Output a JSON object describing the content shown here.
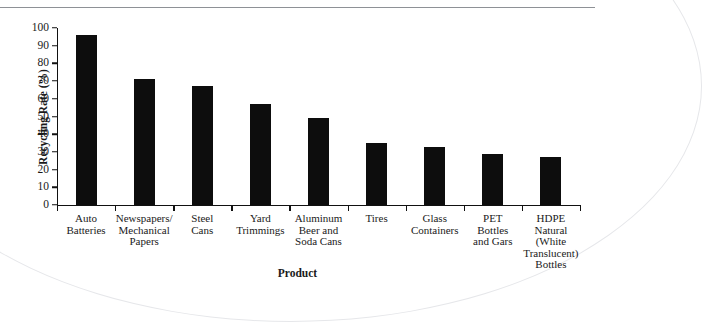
{
  "figure": {
    "clipped_header_text": "",
    "artifacts": {
      "top_rule": "horizontal-rule",
      "page_curl": "scan-curl-arc"
    }
  },
  "chart_data": {
    "type": "bar",
    "title": "",
    "xlabel": "Product",
    "ylabel": "Recycling Rate (%)",
    "ylim": [
      0,
      100
    ],
    "ytick_step": 10,
    "grid": false,
    "legend": null,
    "bar_color": "#0d0d0d",
    "axis_color": "#111111",
    "categories": [
      "Auto Batteries",
      "Newspapers/ Mechanical Papers",
      "Steel Cans",
      "Yard Trimmings",
      "Aluminum Beer and Soda Cans",
      "Tires",
      "Glass Containers",
      "PET Bottles and Gars",
      "HDPE Natural (White Translucent) Bottles"
    ],
    "category_lines": [
      [
        "Auto",
        "Batteries"
      ],
      [
        "Newspapers/",
        "Mechanical",
        "Papers"
      ],
      [
        "Steel",
        "Cans"
      ],
      [
        "Yard",
        "Trimmings"
      ],
      [
        "Aluminum",
        "Beer and",
        "Soda Cans"
      ],
      [
        "Tires"
      ],
      [
        "Glass",
        "Containers"
      ],
      [
        "PET",
        "Bottles",
        "and Gars"
      ],
      [
        "HDPE",
        "Natural",
        "(White",
        "Translucent)",
        "Bottles"
      ]
    ],
    "values": [
      96,
      71,
      67,
      57,
      49,
      35,
      33,
      29,
      27
    ],
    "ytick_labels": [
      "0",
      "10",
      "20",
      "30",
      "40",
      "50",
      "60",
      "70",
      "80",
      "90",
      "100"
    ]
  }
}
